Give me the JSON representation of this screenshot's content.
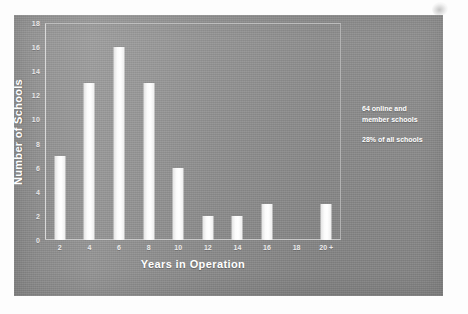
{
  "chart_data": {
    "type": "bar",
    "title": "",
    "subtitle": "",
    "xlabel": "Years in Operation",
    "ylabel": "Number of Schools",
    "categories": [
      "2",
      "4",
      "6",
      "8",
      "10",
      "12",
      "14",
      "16",
      "18",
      "20 +"
    ],
    "values": [
      7,
      13,
      16,
      13,
      6,
      2,
      2,
      3,
      0,
      3
    ],
    "ylim": [
      0,
      18
    ],
    "y_ticks": [
      "0",
      "2",
      "4",
      "6",
      "8",
      "10",
      "12",
      "14",
      "16",
      "18"
    ],
    "grid": false,
    "legend": "none",
    "annotations": [
      "64 online and member schools",
      "28% of all schools"
    ]
  },
  "annotation": {
    "line1": "64 online and",
    "line2": "member schools",
    "line3": "28% of all schools"
  },
  "colors": {
    "panel_background": "#8f8f8f",
    "bar_fill": "#ffffff",
    "axis": "#d9d9d9",
    "text": "#ffffff",
    "page_background": "#fdfdfd"
  }
}
